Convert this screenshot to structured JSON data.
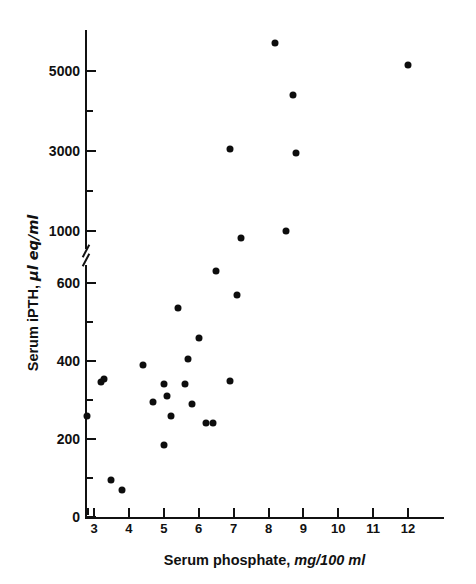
{
  "chart_data": {
    "type": "scatter",
    "title": "",
    "xlabel": "Serum phosphate, mg/100 ml",
    "xlabel_main": "Serum phosphate,",
    "xlabel_unit": "mg/100 ml",
    "ylabel": "Serum iPTH, µl eq/ml",
    "ylabel_main": "Serum iPTH,",
    "ylabel_unit": "µl eq/ml",
    "grid": false,
    "legend": false,
    "broken_y_axis": true,
    "y_break_between": [
      600,
      1000
    ],
    "xlim": [
      2.7,
      12.3
    ],
    "xticks": [
      3,
      4,
      5,
      6,
      7,
      8,
      9,
      10,
      11,
      12
    ],
    "xtick_labels": [
      "3",
      "4",
      "5",
      "6",
      "7",
      "8",
      "9",
      "10",
      "11",
      "12"
    ],
    "yticks_lower": [
      0,
      200,
      400,
      600
    ],
    "ytick_labels_lower": [
      "0",
      "200",
      "400",
      "600"
    ],
    "yticks_lower_minor": [
      100,
      300,
      500
    ],
    "yticks_upper": [
      1000,
      3000,
      5000
    ],
    "ytick_labels_upper": [
      "1000",
      "3000",
      "5000"
    ],
    "yticks_upper_minor": [
      2000,
      4000
    ],
    "ylim_lower": [
      0,
      700
    ],
    "ylim_upper": [
      1000,
      6200
    ],
    "marker": "filled-circle",
    "marker_color": "#0d0d0d",
    "points": [
      {
        "x": 2.8,
        "y": 260
      },
      {
        "x": 3.2,
        "y": 345
      },
      {
        "x": 3.3,
        "y": 355
      },
      {
        "x": 3.5,
        "y": 95
      },
      {
        "x": 3.8,
        "y": 70
      },
      {
        "x": 4.4,
        "y": 390
      },
      {
        "x": 4.7,
        "y": 295
      },
      {
        "x": 5.0,
        "y": 185
      },
      {
        "x": 5.0,
        "y": 340
      },
      {
        "x": 5.1,
        "y": 310
      },
      {
        "x": 5.2,
        "y": 260
      },
      {
        "x": 5.4,
        "y": 535
      },
      {
        "x": 5.6,
        "y": 340
      },
      {
        "x": 5.7,
        "y": 405
      },
      {
        "x": 5.8,
        "y": 290
      },
      {
        "x": 6.0,
        "y": 460
      },
      {
        "x": 6.2,
        "y": 240
      },
      {
        "x": 6.4,
        "y": 240
      },
      {
        "x": 6.5,
        "y": 630
      },
      {
        "x": 6.9,
        "y": 350
      },
      {
        "x": 6.9,
        "y": 3050
      },
      {
        "x": 7.1,
        "y": 570
      },
      {
        "x": 7.2,
        "y": 830
      },
      {
        "x": 8.2,
        "y": 5700
      },
      {
        "x": 8.5,
        "y": 1010
      },
      {
        "x": 8.7,
        "y": 4400
      },
      {
        "x": 8.8,
        "y": 2950
      },
      {
        "x": 12.0,
        "y": 5150
      }
    ]
  }
}
